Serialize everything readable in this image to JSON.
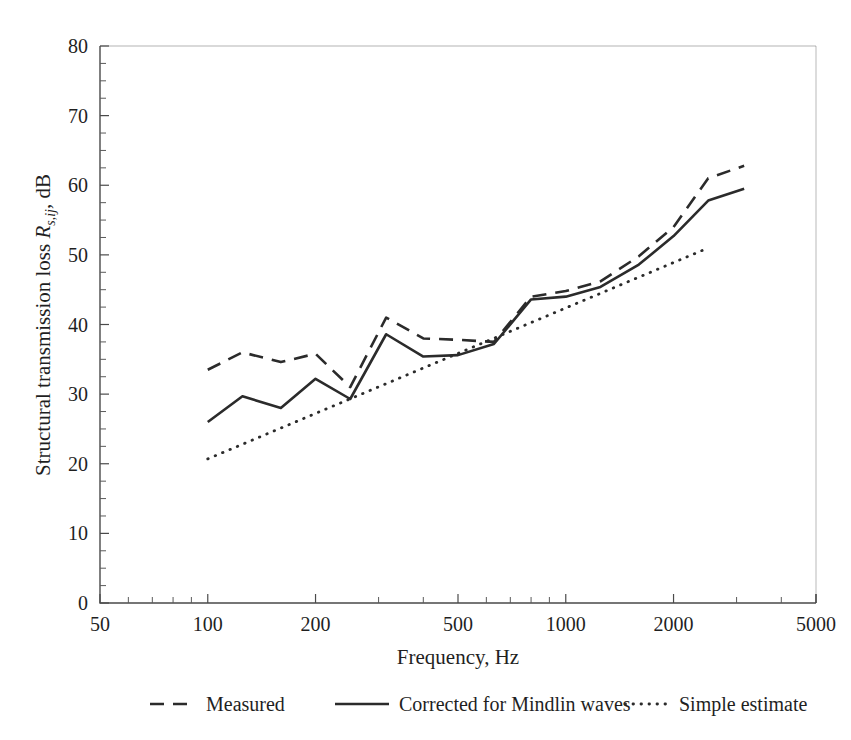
{
  "chart_data": {
    "type": "line",
    "title": "",
    "xlabel": "Frequency, Hz",
    "ylabel": "Structural transmission loss R_{s,ij}, dB",
    "xscale": "log",
    "xlim": [
      50,
      5000
    ],
    "ylim": [
      0,
      80
    ],
    "xticks": [
      50,
      100,
      200,
      500,
      1000,
      2000,
      5000
    ],
    "xticklabels": [
      "50",
      "100",
      "200",
      "500",
      "1000",
      "2000",
      "5000"
    ],
    "yticks": [
      0,
      10,
      20,
      30,
      40,
      50,
      60,
      70,
      80
    ],
    "yticklabels": [
      "0",
      "10",
      "20",
      "30",
      "40",
      "50",
      "60",
      "70",
      "80"
    ],
    "y_minor_step": 2.5,
    "grid": false,
    "legend_position": "below",
    "series": [
      {
        "name": "Measured",
        "style": "dashed",
        "color": "#2b2b2b",
        "x": [
          100,
          125,
          160,
          200,
          250,
          315,
          400,
          500,
          630,
          800,
          1000,
          1250,
          1600,
          2000,
          2500,
          3150
        ],
        "y": [
          33.5,
          36.0,
          34.6,
          35.8,
          31.0,
          41.0,
          38.0,
          37.8,
          37.5,
          44.0,
          44.8,
          46.2,
          49.8,
          54.0,
          61.0,
          62.8
        ]
      },
      {
        "name": "Corrected for Mindlin waves",
        "style": "solid",
        "color": "#2b2b2b",
        "x": [
          100,
          125,
          160,
          200,
          250,
          315,
          400,
          500,
          630,
          800,
          1000,
          1250,
          1600,
          2000,
          2500,
          3150
        ],
        "y": [
          26.0,
          29.7,
          28.0,
          32.2,
          29.3,
          38.6,
          35.4,
          35.6,
          37.2,
          43.6,
          44.0,
          45.4,
          48.6,
          52.7,
          57.8,
          59.5
        ]
      },
      {
        "name": "Simple estimate",
        "style": "dotted",
        "color": "#3a3a3a",
        "x": [
          100,
          2500
        ],
        "y": [
          20.7,
          51.0
        ]
      }
    ]
  },
  "legend": {
    "items": [
      {
        "label": "Measured",
        "style": "dashed"
      },
      {
        "label": "Corrected for Mindlin waves",
        "style": "solid"
      },
      {
        "label": "Simple estimate",
        "style": "dotted"
      }
    ]
  },
  "axis": {
    "x_title": "Frequency, Hz",
    "y_title_main": "Structural transmission loss ",
    "y_title_symbol": "R",
    "y_title_sub": "s,ij",
    "y_title_tail": ", dB"
  }
}
